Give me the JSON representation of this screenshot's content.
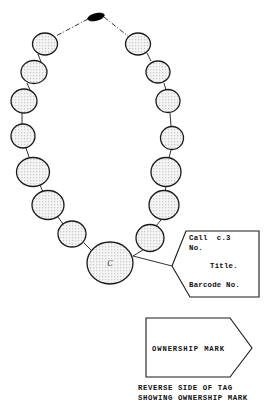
{
  "figure": {
    "kind": "line-drawing-diagram",
    "background_color": "#ffffff",
    "ink_color": "#1a1a1a",
    "bead_fill": "#f2f2f2",
    "bead_stipple_color": "#555555",
    "clasp_color": "#000000"
  },
  "necklace": {
    "clasp": {
      "name": "clasp",
      "cx": 96,
      "cy": 17,
      "rx": 8.5,
      "ry": 3.4,
      "rotation": -14
    },
    "ownership_bead": {
      "name": "large-bead-with-ownership-mark",
      "cx": 110,
      "cy": 263,
      "rx": 23,
      "ry": 21,
      "mark": "C"
    },
    "beads_left": [
      {
        "cx": 45,
        "cy": 44,
        "rx": 12.5,
        "ry": 11
      },
      {
        "cx": 34,
        "cy": 72,
        "rx": 13,
        "ry": 11.5
      },
      {
        "cx": 24,
        "cy": 101,
        "rx": 13,
        "ry": 12
      },
      {
        "cx": 23,
        "cy": 136,
        "rx": 12,
        "ry": 12
      },
      {
        "cx": 33,
        "cy": 172,
        "rx": 16.5,
        "ry": 14.5
      },
      {
        "cx": 48,
        "cy": 205,
        "rx": 16,
        "ry": 14.5
      },
      {
        "cx": 72,
        "cy": 234,
        "rx": 14,
        "ry": 13
      }
    ],
    "beads_right": [
      {
        "cx": 138,
        "cy": 44,
        "rx": 12.5,
        "ry": 11
      },
      {
        "cx": 158,
        "cy": 72,
        "rx": 12,
        "ry": 11
      },
      {
        "cx": 168,
        "cy": 101,
        "rx": 12,
        "ry": 11.5
      },
      {
        "cx": 172,
        "cy": 138,
        "rx": 11.5,
        "ry": 11.5
      },
      {
        "cx": 166,
        "cy": 172,
        "rx": 15,
        "ry": 14.5
      },
      {
        "cx": 164,
        "cy": 205,
        "rx": 15,
        "ry": 14.5
      },
      {
        "cx": 150,
        "cy": 238,
        "rx": 14,
        "ry": 13.5
      }
    ]
  },
  "tag": {
    "name": "catalogue-tag",
    "lines": [
      {
        "text": "Call  c.3",
        "x": 189,
        "y": 240
      },
      {
        "text": "No.",
        "x": 189,
        "y": 250
      },
      {
        "text": "Title.",
        "x": 210,
        "y": 268
      },
      {
        "text": "Barcode No.",
        "x": 189,
        "y": 287
      }
    ]
  },
  "reverse_tag": {
    "name": "reverse-side-tag",
    "mark_label": "OWNERSHIP MARK",
    "caption_lines": [
      "REVERSE SIDE OF TAG",
      "SHOWING OWNERSHIP MARK"
    ]
  }
}
